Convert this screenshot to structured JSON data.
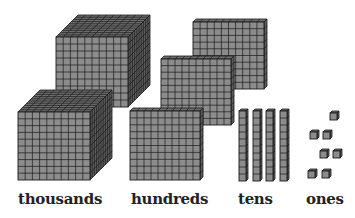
{
  "colors": {
    "face": "#8c8c8c",
    "top": "#6e6e6e",
    "side": "#5c5c5c",
    "grid": "#1a1a1a",
    "label": "#222222"
  },
  "labels": {
    "thousands": "thousands",
    "hundreds": "hundreds",
    "tens": "tens",
    "ones": "ones"
  },
  "blocks": {
    "thousands_count": 2,
    "hundreds_count": 3,
    "tens_count": 4,
    "ones_count": 7
  }
}
